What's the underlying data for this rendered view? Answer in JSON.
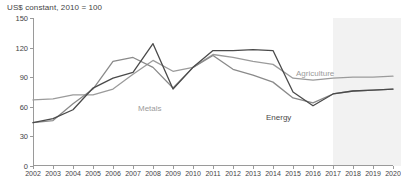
{
  "chart_data": {
    "type": "line",
    "title": "US$ constant, 2010 = 100",
    "xlabel": "",
    "ylabel": "",
    "ylim": [
      0,
      150
    ],
    "yticks": [
      0,
      30,
      60,
      90,
      120,
      150
    ],
    "grid": false,
    "legend_position": "inline-annotations",
    "x": [
      2002,
      2003,
      2004,
      2005,
      2006,
      2007,
      2008,
      2009,
      2010,
      2011,
      2012,
      2013,
      2014,
      2015,
      2016,
      2017,
      2018,
      2019,
      2020
    ],
    "categories": [
      "2002",
      "2003",
      "2004",
      "2005",
      "2006",
      "2007",
      "2008",
      "2009",
      "2010",
      "2011",
      "2012",
      "2013",
      "2014",
      "2015",
      "2016",
      "2017",
      "2018",
      "2019",
      "2020"
    ],
    "series": [
      {
        "name": "Agriculture",
        "color": "#9b9b9b",
        "values": [
          67,
          68,
          72,
          72,
          78,
          93,
          107,
          96,
          100,
          113,
          110,
          106,
          103,
          89,
          87,
          89,
          90,
          90,
          91
        ]
      },
      {
        "name": "Metals",
        "color": "#8a8a8a",
        "values": [
          44,
          46,
          63,
          78,
          106,
          110,
          100,
          79,
          100,
          112,
          98,
          92,
          85,
          69,
          64,
          73,
          76,
          77,
          78
        ]
      },
      {
        "name": "Energy",
        "color": "#4a4a4a",
        "values": [
          44,
          48,
          57,
          79,
          89,
          95,
          124,
          78,
          100,
          117,
          117,
          118,
          117,
          75,
          61,
          73,
          76,
          77,
          78
        ]
      }
    ],
    "annotations": [
      {
        "text": "Agriculture",
        "color": "#9b9b9b",
        "x_px": 296,
        "y_px": 69
      },
      {
        "text": "Metals",
        "color": "#9b9b9b",
        "x_px": 138,
        "y_px": 104
      },
      {
        "text": "Energy",
        "color": "#4a4a4a",
        "x_px": 266,
        "y_px": 113
      }
    ],
    "shaded_region": {
      "label": "forecast",
      "start": 2017,
      "end": 2020,
      "color": "#f2f2f2"
    }
  }
}
